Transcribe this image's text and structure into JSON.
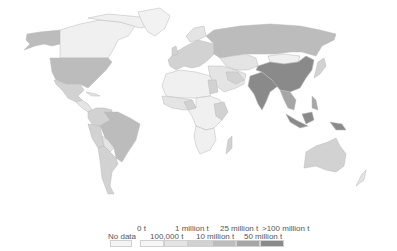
{
  "map": {
    "type": "choropleth",
    "projection": "world",
    "metric_unit": "t",
    "country_classes": {
      "United States": "10m-25m",
      "Alaska": "10m-25m",
      "Canada": "100k-1m",
      "Greenland": "nodata",
      "Mexico": "1m-10m",
      "Brazil": "10m-25m",
      "Argentina": "1m-10m",
      "Chile": "1m-10m",
      "Peru": "1m-10m",
      "Colombia": "1m-10m",
      "Venezuela": "1m-10m",
      "Bolivia": "100k-1m",
      "Russia": "10m-25m",
      "Kazakhstan": "100k-1m",
      "China": "50m-100m",
      "India": "50m-100m",
      "Mongolia": "100k-1m",
      "Southeast Asia": "25m-50m",
      "Indonesia": "50m-100m",
      "Philippines": "25m-50m",
      "Japan": "1m-10m",
      "Australia": "1m-10m",
      "Europe": "1m-10m",
      "Egypt": "1m-10m",
      "Nigeria": "1m-10m",
      "Africa (most)": "100k-1m",
      "Madagascar": "1m-10m",
      "Iran": "1m-10m",
      "Tanzania": "1m-10m"
    }
  },
  "legend": {
    "no_data_label": "No data",
    "top_labels": [
      "0 t",
      "1 million t",
      "25 million t",
      ">100 million t"
    ],
    "bottom_labels": [
      "100,000 t",
      "10 million t",
      "50 million t"
    ],
    "colors": {
      "nodata": "#f4f4f4",
      "0-100k": "#f6f6f6",
      "100k-1m": "#e4e4e4",
      "1m-10m": "#d2d2d2",
      "10m-25m": "#bcbcbc",
      "25m-50m": "#a6a6a6",
      "50m-100m": "#8a8a8a"
    },
    "swatch_order": [
      "0-100k",
      "100k-1m",
      "1m-10m",
      "10m-25m",
      "25m-50m",
      "50m-100m"
    ]
  }
}
